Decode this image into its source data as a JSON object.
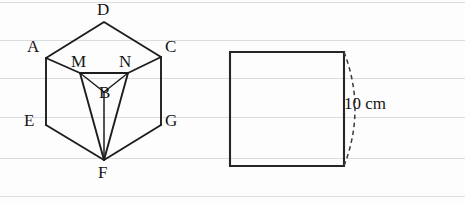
{
  "page": {
    "width": 465,
    "height": 203,
    "background_color": "#fdfdfd",
    "rule_color": "#d8dde2",
    "ink_color": "#1d1d1d",
    "ruled_lines_y": [
      2,
      40,
      78,
      117,
      158,
      196
    ]
  },
  "figure_left": {
    "name": "cube-with-inscribed-tetrahedron",
    "vertex_labels": {
      "D": "D",
      "A": "A",
      "C": "C",
      "M": "M",
      "N": "N",
      "B": "B",
      "E": "E",
      "G": "G",
      "F": "F"
    },
    "vertex_points": {
      "D": [
        104,
        22
      ],
      "A": [
        46,
        58
      ],
      "C": [
        161,
        57
      ],
      "M": [
        80,
        73
      ],
      "N": [
        128,
        73
      ],
      "B": [
        104,
        92
      ],
      "E": [
        46,
        125
      ],
      "G": [
        161,
        125
      ],
      "F": [
        104,
        160
      ]
    },
    "label_positions": {
      "D": [
        97,
        1
      ],
      "A": [
        27,
        38
      ],
      "C": [
        165,
        38
      ],
      "M": [
        72,
        53
      ],
      "N": [
        120,
        53
      ],
      "B": [
        104,
        84
      ],
      "E": [
        25,
        113
      ],
      "G": [
        166,
        113
      ],
      "F": [
        98,
        165
      ]
    }
  },
  "figure_right": {
    "name": "square-with-dashed-arc",
    "square": {
      "x": 230,
      "y": 52,
      "width": 114,
      "height": 114
    },
    "arc_bulge": 18,
    "dimension_label": "10 cm",
    "dimension_label_position": [
      346,
      103
    ]
  }
}
